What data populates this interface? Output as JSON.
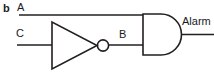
{
  "figure": {
    "panel_letter": "b",
    "type": "logic-circuit-diagram",
    "stroke_color": "#231f20",
    "background_color": "#ffffff"
  },
  "labels": {
    "input_a": "A",
    "input_c": "C",
    "node_b": "B",
    "output": "Alarm"
  },
  "gates": [
    {
      "name": "not-gate",
      "symbol": "inverter-triangle-with-bubble",
      "input": "C",
      "output": "B"
    },
    {
      "name": "and-gate",
      "symbol": "and-d-shape",
      "inputs": [
        "A",
        "B"
      ],
      "output": "Alarm"
    }
  ],
  "wires": [
    {
      "name": "wire-a",
      "from": "A",
      "to": "and-gate-input-top"
    },
    {
      "name": "wire-c",
      "from": "C",
      "to": "not-gate-input"
    },
    {
      "name": "wire-b",
      "from": "not-gate-output",
      "to": "and-gate-input-bottom"
    },
    {
      "name": "wire-alarm",
      "from": "and-gate-output",
      "to": "Alarm"
    }
  ]
}
